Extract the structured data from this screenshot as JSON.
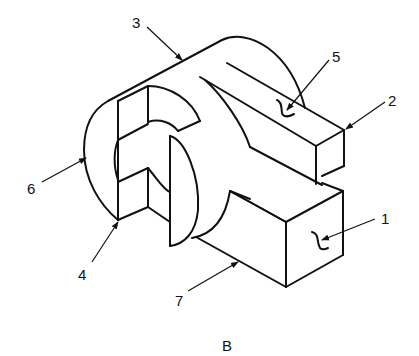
{
  "figure": {
    "caption": "B",
    "labels": [
      {
        "id": "1",
        "text": "1",
        "x": 381,
        "y": 224
      },
      {
        "id": "2",
        "text": "2",
        "x": 388,
        "y": 106
      },
      {
        "id": "3",
        "text": "3",
        "x": 132,
        "y": 28
      },
      {
        "id": "4",
        "text": "4",
        "x": 78,
        "y": 280
      },
      {
        "id": "5",
        "text": "5",
        "x": 332,
        "y": 62
      },
      {
        "id": "6",
        "text": "6",
        "x": 27,
        "y": 194
      },
      {
        "id": "7",
        "text": "7",
        "x": 175,
        "y": 306
      }
    ],
    "colors": {
      "stroke": "#111111",
      "background": "#ffffff"
    }
  }
}
